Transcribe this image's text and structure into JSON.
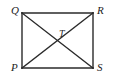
{
  "figure": {
    "kind": "geometry-diagram",
    "background_color": "#ffffff",
    "stroke_color": "#2a2a2a",
    "label_color": "#222222",
    "stroke_width": 1.4
  },
  "rectangle": {
    "name": "rectangle-PQRS",
    "corners": {
      "top_left": {
        "label": "Q",
        "x": 22,
        "y": 13
      },
      "top_right": {
        "label": "R",
        "x": 93,
        "y": 13
      },
      "bottom_right": {
        "label": "S",
        "x": 93,
        "y": 68
      },
      "bottom_left": {
        "label": "P",
        "x": 22,
        "y": 68
      }
    }
  },
  "diagonals": [
    {
      "name": "diagonal-Q-S",
      "from": "Q",
      "to": "S",
      "x1": 22,
      "y1": 13,
      "x2": 93,
      "y2": 68
    },
    {
      "name": "diagonal-P-R",
      "from": "P",
      "to": "R",
      "x1": 22,
      "y1": 68,
      "x2": 93,
      "y2": 13
    }
  ],
  "intersection": {
    "label": "T",
    "x": 57,
    "y": 41
  },
  "labels": {
    "Q": "Q",
    "R": "R",
    "P": "P",
    "S": "S",
    "T": "T"
  }
}
